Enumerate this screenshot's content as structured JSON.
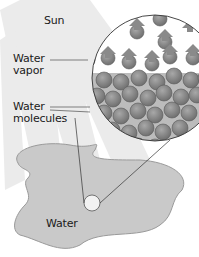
{
  "diagram": {
    "labels": {
      "sun": "Sun",
      "water_vapor_line1": "Water",
      "water_vapor_line2": "vapor",
      "water_molecules_line1": "Water",
      "water_molecules_line2": "molecules",
      "water": "Water"
    },
    "colors": {
      "background": "#ffffff",
      "sun_rays": "#e6e6e6",
      "puddle_fill": "#c8c8c8",
      "puddle_stroke": "#9a9a9a",
      "liquid_fill": "#bdbdbd",
      "molecule_fill": "#8c8c8c",
      "molecule_stroke": "#5a5a5a",
      "arrow_fill": "#8a8a8a",
      "outline": "#333333"
    }
  }
}
